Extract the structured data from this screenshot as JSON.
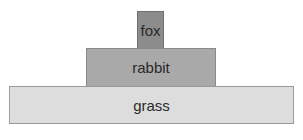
{
  "diagram": {
    "type": "food-pyramid",
    "levels": [
      {
        "label": "fox",
        "color": "#8c8c8c"
      },
      {
        "label": "rabbit",
        "color": "#a9a9a9"
      },
      {
        "label": "grass",
        "color": "#dddddd"
      }
    ]
  }
}
